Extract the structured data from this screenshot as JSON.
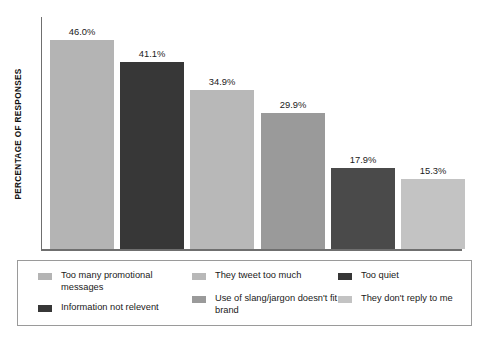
{
  "chart_data": {
    "type": "bar",
    "title": "",
    "xlabel": "",
    "ylabel": "PERCENTAGE OF RESPONSES",
    "ylim": [
      0,
      51
    ],
    "grid": false,
    "legend_position": "bottom",
    "categories": [
      "Too many promotional messages",
      "Information not relevent",
      "They tweet too much",
      "Use of slang/jargon doesn't fit brand",
      "Too quiet",
      "They don't reply to me"
    ],
    "values": [
      46.0,
      41.1,
      34.9,
      29.9,
      17.9,
      15.3
    ],
    "value_labels": [
      "46.0%",
      "41.1%",
      "34.9%",
      "29.9%",
      "17.9%",
      "15.3%"
    ],
    "bar_colors": [
      "#b4b4b4",
      "#373737",
      "#b8b8b8",
      "#9a9a9a",
      "#4a4a4a",
      "#c3c3c3"
    ]
  },
  "axis": {
    "y_title": "PERCENTAGE OF RESPONSES",
    "line_color": "#6f6f6f"
  },
  "legend": {
    "border_color": "#9a9a9a",
    "columns": [
      {
        "left": 20,
        "width": 150,
        "items": [
          {
            "label": "Too many promotional messages",
            "color": "#b4b4b4"
          },
          {
            "label": "Information not relevent",
            "color": "#373737"
          }
        ]
      },
      {
        "left": 174,
        "width": 150,
        "items": [
          {
            "label": "They tweet too much",
            "color": "#b8b8b8"
          },
          {
            "label": "Use of slang/jargon doesn't fit brand",
            "color": "#9a9a9a"
          }
        ]
      },
      {
        "left": 320,
        "width": 135,
        "items": [
          {
            "label": "Too quiet",
            "color": "#373737"
          },
          {
            "label": "They don't reply to me",
            "color": "#c3c3c3"
          }
        ]
      }
    ]
  },
  "caption": {
    "text": ""
  }
}
